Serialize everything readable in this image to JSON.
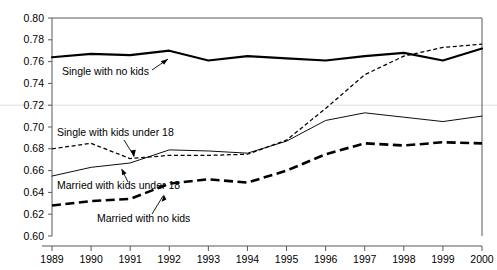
{
  "chart_data": {
    "type": "line",
    "title": "",
    "subtitle": "",
    "xlabel": "",
    "ylabel": "",
    "categories": [
      1989,
      1990,
      1991,
      1992,
      1993,
      1994,
      1995,
      1996,
      1997,
      1998,
      1999,
      2000
    ],
    "x": [
      1989,
      1990,
      1991,
      1992,
      1993,
      1994,
      1995,
      1996,
      1997,
      1998,
      1999,
      2000
    ],
    "xlim": [
      1989,
      2000
    ],
    "ylim": [
      0.6,
      0.8
    ],
    "ytick_labels": [
      "0.80",
      "0.78",
      "0.76",
      "0.74",
      "0.72",
      "0.70",
      "0.68",
      "0.66",
      "0.64",
      "0.62",
      "0.60"
    ],
    "ytick_values": [
      0.8,
      0.78,
      0.76,
      0.74,
      0.72,
      0.7,
      0.68,
      0.66,
      0.64,
      0.62,
      0.6
    ],
    "xtick_labels": [
      "1989",
      "1990",
      "1991",
      "1992",
      "1993",
      "1994",
      "1995",
      "1996",
      "1997",
      "1998",
      "1999",
      "2000"
    ],
    "grid": "single faint horizontal gridline at 0.72",
    "legend_position": "inline annotations with leader arrows",
    "series": [
      {
        "name": "Single with no kids",
        "style": "thick-solid",
        "label_text": "Single with no kids",
        "values": [
          0.764,
          0.767,
          0.766,
          0.77,
          0.761,
          0.765,
          0.763,
          0.761,
          0.765,
          0.768,
          0.761,
          0.772
        ]
      },
      {
        "name": "Single with kids under 18",
        "style": "fine-dotted",
        "label_text": "Single with kids under 18",
        "values": [
          0.68,
          0.685,
          0.671,
          0.674,
          0.674,
          0.675,
          0.688,
          0.717,
          0.748,
          0.765,
          0.773,
          0.776
        ]
      },
      {
        "name": "Married with kids under 18",
        "style": "thin-solid",
        "label_text": "Married with kids under 18",
        "values": [
          0.655,
          0.663,
          0.667,
          0.679,
          0.678,
          0.676,
          0.687,
          0.706,
          0.713,
          0.709,
          0.705,
          0.71
        ]
      },
      {
        "name": "Married with no kids",
        "style": "thick-dashed",
        "label_text": "Married with no kids",
        "values": [
          0.628,
          0.632,
          0.634,
          0.648,
          0.652,
          0.649,
          0.66,
          0.675,
          0.685,
          0.683,
          0.686,
          0.685
        ]
      }
    ],
    "colors": {
      "axis": "#555a5e",
      "lines": "#000000",
      "gridline": "#d8dde0",
      "background": "#ffffff"
    }
  }
}
